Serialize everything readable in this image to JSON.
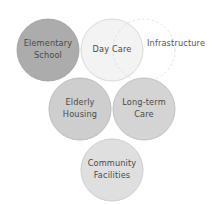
{
  "diagram": {
    "background_color": "#ffffff",
    "text_color": "#4a4a4a",
    "circles": [
      {
        "id": "elementary-school",
        "label_lines": [
          "Elementary",
          "School"
        ],
        "cx": 48,
        "cy": 50,
        "r": 31,
        "fill": "#a9a9a9",
        "stroke": "#9a9a9a",
        "style": "solid"
      },
      {
        "id": "day-care",
        "label_lines": [
          "Day Care"
        ],
        "cx": 112,
        "cy": 50,
        "r": 31,
        "fill": "#f1f1f1",
        "stroke": "#dcdcdc",
        "style": "solid"
      },
      {
        "id": "elderly-housing",
        "label_lines": [
          "Elderly",
          "Housing"
        ],
        "cx": 80,
        "cy": 109,
        "r": 31,
        "fill": "#c9c9c9",
        "stroke": "#bcbcbc",
        "style": "solid"
      },
      {
        "id": "long-term-care",
        "label_lines": [
          "Long-term",
          "Care"
        ],
        "cx": 144,
        "cy": 109,
        "r": 31,
        "fill": "#cfcfcf",
        "stroke": "#c2c2c2",
        "style": "solid"
      },
      {
        "id": "community-facilities",
        "label_lines": [
          "Community",
          "Facilities"
        ],
        "cx": 112,
        "cy": 170,
        "r": 31,
        "fill": "#dbdbdb",
        "stroke": "#cdcdcd",
        "style": "solid"
      },
      {
        "id": "infrastructure",
        "label_lines": [
          "Infrastructure"
        ],
        "cx": 144,
        "cy": 50,
        "r": 31,
        "fill": "none",
        "stroke": "#d8d8d8",
        "style": "dashed"
      }
    ],
    "labels": {
      "elementary_school_line1": "Elementary",
      "elementary_school_line2": "School",
      "day_care": "Day Care",
      "elderly_housing_line1": "Elderly",
      "elderly_housing_line2": "Housing",
      "long_term_care_line1": "Long-term",
      "long_term_care_line2": "Care",
      "community_facilities_line1": "Community",
      "community_facilities_line2": "Facilities",
      "infrastructure": "Infrastructure"
    }
  }
}
